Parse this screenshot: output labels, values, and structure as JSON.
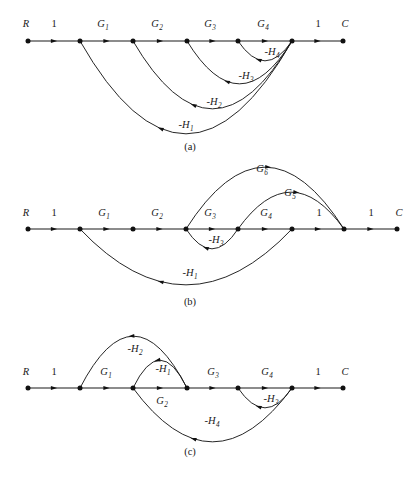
{
  "figure": {
    "type": "signal-flow-graph",
    "background": "#ffffff",
    "ink": "#1a1a1a",
    "panels": [
      {
        "id": "a",
        "caption": "(a)",
        "caption_x": 190,
        "caption_y": 150,
        "baseline_y": 41,
        "nodes": [
          {
            "name": "R",
            "x": 28
          },
          {
            "name": "n2",
            "x": 80
          },
          {
            "name": "n3",
            "x": 133
          },
          {
            "name": "n4",
            "x": 187
          },
          {
            "name": "n5",
            "x": 238
          },
          {
            "name": "n6",
            "x": 292
          },
          {
            "name": "C",
            "x": 343
          }
        ],
        "end_labels": [
          {
            "text": "R",
            "x": 26,
            "y": 27
          },
          {
            "text": "C",
            "x": 345,
            "y": 27
          }
        ],
        "forward_branches": [
          {
            "label": "1",
            "sub": "",
            "from": 28,
            "to": 80,
            "lx": 54,
            "ly": 27
          },
          {
            "label": "G",
            "sub": "1",
            "from": 80,
            "to": 133,
            "lx": 103,
            "ly": 27
          },
          {
            "label": "G",
            "sub": "2",
            "from": 133,
            "to": 187,
            "lx": 157,
            "ly": 27
          },
          {
            "label": "G",
            "sub": "3",
            "from": 187,
            "to": 238,
            "lx": 210,
            "ly": 27
          },
          {
            "label": "G",
            "sub": "4",
            "from": 238,
            "to": 292,
            "lx": 263,
            "ly": 27
          },
          {
            "label": "1",
            "sub": "",
            "from": 292,
            "to": 343,
            "lx": 318,
            "ly": 27
          }
        ],
        "feedback_arcs": [
          {
            "label": "-H",
            "sub": "4",
            "from": 292,
            "to": 238,
            "depth": 20,
            "lx": 272,
            "ly": 55,
            "arrow_t": 0.62
          },
          {
            "label": "-H",
            "sub": "3",
            "from": 292,
            "to": 187,
            "depth": 43,
            "lx": 246,
            "ly": 79,
            "arrow_t": 0.62
          },
          {
            "label": "-H",
            "sub": "2",
            "from": 292,
            "to": 133,
            "depth": 68,
            "lx": 214,
            "ly": 105,
            "arrow_t": 0.62
          },
          {
            "label": "-H",
            "sub": "1",
            "from": 292,
            "to": 80,
            "depth": 93,
            "lx": 186,
            "ly": 128,
            "arrow_t": 0.62
          }
        ]
      },
      {
        "id": "b",
        "caption": "(b)",
        "caption_x": 190,
        "caption_y": 305,
        "baseline_y": 229,
        "nodes": [
          {
            "name": "R",
            "x": 28
          },
          {
            "name": "n2",
            "x": 80
          },
          {
            "name": "n3",
            "x": 133
          },
          {
            "name": "n4",
            "x": 186
          },
          {
            "name": "n5",
            "x": 238
          },
          {
            "name": "n6",
            "x": 292
          },
          {
            "name": "n7",
            "x": 344
          },
          {
            "name": "C",
            "x": 397
          }
        ],
        "end_labels": [
          {
            "text": "R",
            "x": 26,
            "y": 216
          },
          {
            "text": "C",
            "x": 399,
            "y": 216
          }
        ],
        "forward_branches": [
          {
            "label": "1",
            "sub": "",
            "from": 28,
            "to": 80,
            "lx": 54,
            "ly": 216
          },
          {
            "label": "G",
            "sub": "1",
            "from": 80,
            "to": 133,
            "lx": 104,
            "ly": 216
          },
          {
            "label": "G",
            "sub": "2",
            "from": 133,
            "to": 186,
            "lx": 157,
            "ly": 216
          },
          {
            "label": "G",
            "sub": "3",
            "from": 186,
            "to": 238,
            "lx": 210,
            "ly": 216
          },
          {
            "label": "G",
            "sub": "4",
            "from": 238,
            "to": 292,
            "lx": 266,
            "ly": 216
          },
          {
            "label": "1",
            "sub": "",
            "from": 292,
            "to": 344,
            "lx": 319,
            "ly": 216
          },
          {
            "label": "1",
            "sub": "",
            "from": 344,
            "to": 397,
            "lx": 371,
            "ly": 216
          }
        ],
        "upper_arcs": [
          {
            "label": "G",
            "sub": "6",
            "from": 186,
            "to": 344,
            "height": 62,
            "lx": 262,
            "ly": 172,
            "arrow_t": 0.52
          },
          {
            "label": "G",
            "sub": "5",
            "from": 238,
            "to": 344,
            "height": 37,
            "lx": 290,
            "ly": 196,
            "arrow_t": 0.55
          }
        ],
        "feedback_arcs": [
          {
            "label": "-H",
            "sub": "3",
            "from": 238,
            "to": 186,
            "depth": 20,
            "lx": 216,
            "ly": 243,
            "arrow_t": 0.62
          },
          {
            "label": "-H",
            "sub": "1",
            "from": 292,
            "to": 80,
            "depth": 56,
            "lx": 190,
            "ly": 276,
            "arrow_t": 0.62
          }
        ]
      },
      {
        "id": "c",
        "caption": "(c)",
        "caption_x": 190,
        "caption_y": 455,
        "baseline_y": 388,
        "nodes": [
          {
            "name": "R",
            "x": 28
          },
          {
            "name": "n2",
            "x": 80
          },
          {
            "name": "n3",
            "x": 133
          },
          {
            "name": "n4",
            "x": 187
          },
          {
            "name": "n5",
            "x": 238
          },
          {
            "name": "n6",
            "x": 292
          },
          {
            "name": "C",
            "x": 343
          }
        ],
        "end_labels": [
          {
            "text": "R",
            "x": 26,
            "y": 375
          },
          {
            "text": "C",
            "x": 345,
            "y": 375
          }
        ],
        "forward_branches": [
          {
            "label": "1",
            "sub": "",
            "from": 28,
            "to": 80,
            "lx": 54,
            "ly": 375
          },
          {
            "label": "G",
            "sub": "1",
            "from": 80,
            "to": 133,
            "lx": 106,
            "ly": 375
          },
          {
            "label": "G",
            "sub": "3",
            "from": 187,
            "to": 238,
            "lx": 213,
            "ly": 375
          },
          {
            "label": "G",
            "sub": "4",
            "from": 238,
            "to": 292,
            "lx": 267,
            "ly": 375
          },
          {
            "label": "1",
            "sub": "",
            "from": 292,
            "to": 343,
            "lx": 318,
            "ly": 375
          }
        ],
        "plain_branches": [
          {
            "from": 133,
            "to": 187
          }
        ],
        "upper_arcs": [
          {
            "label": "-H",
            "sub": "2",
            "from": 187,
            "to": 80,
            "height": 52,
            "lx": 135,
            "ly": 352,
            "arrow_t": 0.52,
            "reverse": true
          },
          {
            "label": "-H",
            "sub": "1",
            "from": 187,
            "to": 133,
            "height": 28,
            "lx": 163,
            "ly": 372,
            "arrow_t": 0.55,
            "reverse": true
          }
        ],
        "feedback_arcs": [
          {
            "label": "-H",
            "sub": "3",
            "from": 292,
            "to": 238,
            "depth": 20,
            "lx": 271,
            "ly": 402,
            "arrow_t": 0.62
          },
          {
            "label": "-H",
            "sub": "4",
            "from": 292,
            "to": 133,
            "depth": 54,
            "lx": 212,
            "ly": 424,
            "arrow_t": 0.62
          }
        ],
        "extra_labels": [
          {
            "text": "G",
            "sub": "2",
            "x": 162,
            "y": 404
          }
        ]
      }
    ]
  }
}
